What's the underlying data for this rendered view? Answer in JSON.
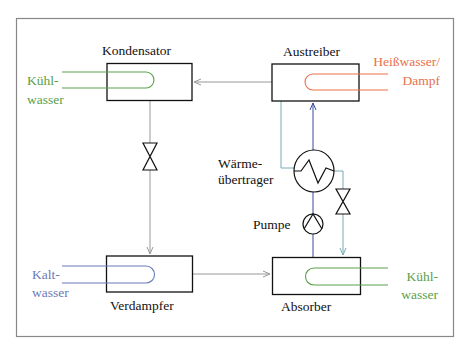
{
  "caption": {
    "fragments": [
      "g",
      "w",
      "g",
      "w"
    ]
  },
  "components": {
    "kondensator": "Kondensator",
    "austreiber": "Austreiber",
    "verdampfer": "Verdampfer",
    "absorber": "Absorber",
    "heat_exchanger_line1": "Wärme-",
    "heat_exchanger_line2": "übertrager",
    "pump": "Pumpe"
  },
  "media": {
    "cooling_water_top_line1": "Kühl-",
    "cooling_water_top_line2": "wasser",
    "hot_water_line1": "Heißwasser/",
    "hot_water_line2": "Dampf",
    "cold_water_line1": "Kalt-",
    "cold_water_line2": "wasser",
    "cooling_water_bottom_line1": "Kühl-",
    "cooling_water_bottom_line2": "wasser"
  },
  "colors": {
    "frame": "#888888",
    "box": "#1a1a1a",
    "refrigerant": "#999999",
    "rich_solution": "#3a4a9a",
    "poor_solution": "#7aaab4",
    "cooling_water": "#5aa04a",
    "hot_water": "#e8704a",
    "cold_water": "#6a7ab8"
  }
}
